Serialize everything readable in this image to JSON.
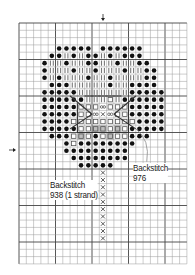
{
  "chart_title": "Cross-stitch pattern chart: flower motif",
  "grid": {
    "left": 19,
    "top": 23,
    "cell": 7.3,
    "cols": 23,
    "rows": 33,
    "major_every": 5,
    "line_color": "#9a9a9a",
    "major_line_color": "#444444"
  },
  "center_markers": {
    "top_arrow": {
      "x": 103,
      "y": 19
    },
    "left_arrow": {
      "x": 13,
      "y": 150
    }
  },
  "legend_symbols": {
    "D": "filled-dot",
    "I": "vertical-bars",
    "S": "open-square",
    "O": "infinity",
    "X": "cross",
    "H": "half-shade"
  },
  "pattern_rows": [
    {
      "row": 3,
      "cells": ".....DDDDD.DDDDDD......"
    },
    {
      "row": 4,
      "cells": "....DDIDIDDIDIDDD......"
    },
    {
      "row": 5,
      "cells": "...DIIDIIDDIIDIIDD....."
    },
    {
      "row": 6,
      "cells": "...DIIIDIIDIIIDIIDD...."
    },
    {
      "row": 7,
      "cells": "...DIDIIIDIIDIIIIDD...."
    },
    {
      "row": 8,
      "cells": "....DDDIIIIIDIIDDDD...."
    },
    {
      "row": 9,
      "cells": "...DDDDDIIIIIIIDDDDD..."
    },
    {
      "row": 10,
      "cells": "...DDDDDDIIISIDDDDDD..."
    },
    {
      "row": 11,
      "cells": "...DDDDDSSSOSSSDDDDD..."
    },
    {
      "row": 12,
      "cells": "...DDDDDSSOXOSSDDDDD..."
    },
    {
      "row": 13,
      "cells": "...DDDDSSSSSSSSSDDDD..."
    },
    {
      "row": 14,
      "cells": "...DDDDDSSHHSHSDDDDD..."
    },
    {
      "row": 15,
      "cells": "....DDDSHSDSHSSDDD....."
    },
    {
      "row": 16,
      "cells": "......DSDDDDDDDD......."
    },
    {
      "row": 17,
      "cells": "......DDDDDDDDD........"
    },
    {
      "row": 18,
      "cells": ".......DDDDDDDD........"
    },
    {
      "row": 19,
      "cells": "........DDDDD.........."
    }
  ],
  "stem": {
    "col": 11,
    "from_row": 20,
    "to_row": 29,
    "symbol": "X"
  },
  "labels": [
    {
      "id": "backstitch-976",
      "lines": [
        "Backstitch",
        "976"
      ],
      "x": 133,
      "y": 163
    },
    {
      "id": "backstitch-938",
      "lines": [
        "Backstitch",
        "938 (1 strand)"
      ],
      "x": 50,
      "y": 180
    }
  ],
  "colors": {
    "symbol": "#111111",
    "shade": "#bdbdbd",
    "backstitch": "#333333",
    "leader": "#8a8a8a"
  }
}
